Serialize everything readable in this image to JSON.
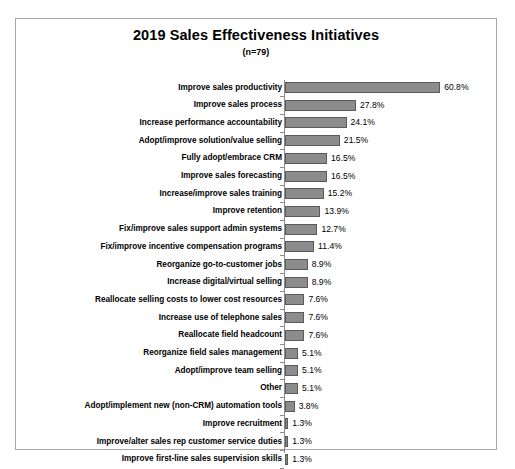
{
  "chart": {
    "title": "2019 Sales Effectiveness Initiatives",
    "subtitle": "(n=79)"
  },
  "chart_data": {
    "type": "bar",
    "orientation": "horizontal",
    "title": "2019 Sales Effectiveness Initiatives",
    "subtitle": "(n=79)",
    "xlabel": "",
    "ylabel": "",
    "xlim": [
      0,
      60.8
    ],
    "grid": false,
    "legend": false,
    "value_suffix": "%",
    "categories": [
      "Improve sales productivity",
      "Improve sales process",
      "Increase performance accountability",
      "Adopt/improve solution/value selling",
      "Fully adopt/embrace CRM",
      "Improve sales forecasting",
      "Increase/improve sales training",
      "Improve retention",
      "Fix/improve sales support admin systems",
      "Fix/improve incentive compensation programs",
      "Reorganize go-to-customer jobs",
      "Increase digital/virtual selling",
      "Reallocate selling costs to lower cost resources",
      "Increase use of telephone sales",
      "Reallocate field headcount",
      "Reorganize field sales management",
      "Adopt/improve team selling",
      "Other",
      "Adopt/implement new (non-CRM) automation tools",
      "Improve recruitment",
      "Improve/alter sales rep customer service duties",
      "Improve first-line sales supervision skills"
    ],
    "values": [
      60.8,
      27.8,
      24.1,
      21.5,
      16.5,
      16.5,
      15.2,
      13.9,
      12.7,
      11.4,
      8.9,
      8.9,
      7.6,
      7.6,
      7.6,
      5.1,
      5.1,
      5.1,
      3.8,
      1.3,
      1.3,
      1.3
    ],
    "value_labels": [
      "60.8%",
      "27.8%",
      "24.1%",
      "21.5%",
      "16.5%",
      "16.5%",
      "15.2%",
      "13.9%",
      "12.7%",
      "11.4%",
      "8.9%",
      "8.9%",
      "7.6%",
      "7.6%",
      "7.6%",
      "5.1%",
      "5.1%",
      "5.1%",
      "3.8%",
      "1.3%",
      "1.3%",
      "1.3%"
    ],
    "colors": {
      "bar_fill": "#8c8c8c",
      "bar_border": "#5a5a5a",
      "axis": "#8c8c8c",
      "frame": "#a6a6a6",
      "background": "#ffffff",
      "text": "#000000"
    }
  }
}
